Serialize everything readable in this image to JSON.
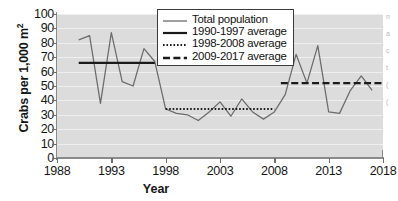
{
  "chart_data": {
    "type": "line",
    "title": "",
    "xlabel": "Year",
    "ylabel": "Crabs per 1,000 m²",
    "xlim": [
      1988,
      2018
    ],
    "ylim": [
      0,
      100
    ],
    "grid": true,
    "legend_position": "top-center",
    "x": [
      1990,
      1991,
      1992,
      1993,
      1994,
      1995,
      1996,
      1997,
      1998,
      1999,
      2000,
      2001,
      2002,
      2003,
      2004,
      2005,
      2006,
      2007,
      2008,
      2009,
      2010,
      2011,
      2012,
      2013,
      2014,
      2015,
      2016,
      2017
    ],
    "series": [
      {
        "name": "Total population",
        "style": "solid-thin",
        "values": [
          82,
          85,
          38,
          87,
          53,
          50,
          76,
          67,
          34,
          31,
          30,
          26,
          32,
          39,
          29,
          41,
          32,
          27,
          32,
          44,
          72,
          52,
          78,
          32,
          31,
          47,
          57,
          47
        ]
      }
    ],
    "reference_lines": [
      {
        "name": "1990-1997 average",
        "style": "solid-thick",
        "value": 66,
        "x_start": 1990,
        "x_end": 1997
      },
      {
        "name": "1998-2008 average",
        "style": "dotted",
        "value": 34,
        "x_start": 1998,
        "x_end": 2008
      },
      {
        "name": "2009-2017 average",
        "style": "dashed",
        "value": 52,
        "x_start": 2008.6,
        "x_end": 2018
      }
    ],
    "yticks": [
      0,
      10,
      20,
      30,
      40,
      50,
      60,
      70,
      80,
      90,
      100
    ],
    "xticks": [
      1988,
      1993,
      1998,
      2003,
      2008,
      2013,
      2018
    ],
    "colors": {
      "plot_background": "#dcdcdc",
      "gridline": "#efefef",
      "data_line": "#6b6b6b",
      "reference_line": "#1a1a1a",
      "axis": "#8a8a8a",
      "text": "#161616"
    }
  },
  "legend": {
    "entries": [
      {
        "label": "Total population",
        "style": "solid-thin"
      },
      {
        "label": "1990-1997 average",
        "style": "solid-thick"
      },
      {
        "label": "1998-2008 average",
        "style": "dotted"
      },
      {
        "label": "2009-2017 average",
        "style": "dashed"
      }
    ]
  },
  "margin_text": [
    "n",
    "a",
    "c",
    "t",
    "(",
    "("
  ]
}
